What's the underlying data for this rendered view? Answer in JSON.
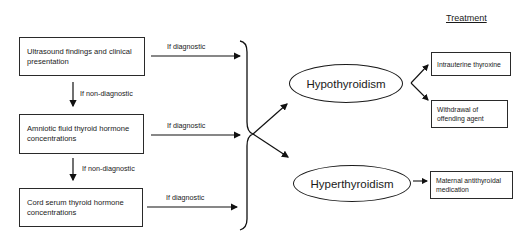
{
  "diagram": {
    "tests": [
      {
        "label": "Ultrasound findings and clinical presentation"
      },
      {
        "label": "Amniotic fluid thyroid hormone concentrations"
      },
      {
        "label": "Cord serum thyroid hormone concentrations"
      }
    ],
    "edge_labels": {
      "diagnostic": [
        "If diagnostic",
        "If diagnostic",
        "If diagnostic"
      ],
      "non_diagnostic": [
        "If non-diagnostic",
        "If non-diagnostic"
      ]
    },
    "diagnoses": [
      {
        "label": "Hypothyroidism"
      },
      {
        "label": "Hyperthyroidism"
      }
    ],
    "treatment_heading": "Treatment",
    "treatments": [
      {
        "label": "Intrauterine thyroxine",
        "for": "Hypothyroidism"
      },
      {
        "label": "Withdrawal of offending agent",
        "for": "Hypothyroidism"
      },
      {
        "label": "Maternal antithyroidal medication",
        "for": "Hyperthyroidism"
      }
    ]
  }
}
